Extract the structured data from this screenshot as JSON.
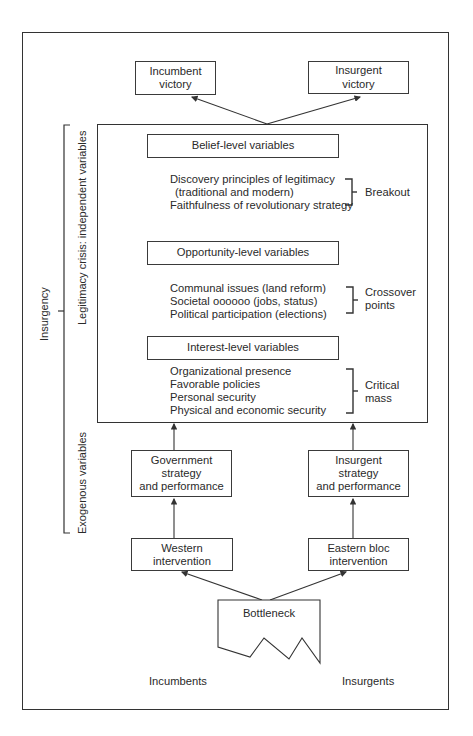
{
  "outcomes": {
    "incumbent_victory": "Incumbent\nvictory",
    "insurgent_victory": "Insurgent\nvictory"
  },
  "side_labels": {
    "insurgency": "Insurgency",
    "legitimacy_crisis": "Legitimacy crisis: independent variables",
    "exogenous": "Exogenous variables"
  },
  "levels": [
    {
      "header": "Belief-level variables",
      "items": [
        "Discovery principles of legitimacy",
        "(traditional and modern)",
        "Faithfulness of revolutionary strategy"
      ],
      "threshold": "Breakout"
    },
    {
      "header": "Opportunity-level variables",
      "items": [
        "Communal issues (land reform)",
        "Societal oooooo (jobs, status)",
        "Political participation (elections)"
      ],
      "threshold": "Crossover\npoints"
    },
    {
      "header": "Interest-level variables",
      "items": [
        "Organizational presence",
        "Favorable policies",
        "Personal security",
        "Physical and economic security"
      ],
      "threshold": "Critical\nmass"
    }
  ],
  "strategy": {
    "government": "Government\nstrategy\nand performance",
    "insurgent": "Insurgent\nstrategy\nand performance"
  },
  "intervention": {
    "western": "Western\nintervention",
    "eastern": "Eastern bloc\nintervention"
  },
  "bottleneck": "Bottleneck",
  "actors": {
    "incumbents": "Incumbents",
    "insurgents": "Insurgents"
  },
  "colors": {
    "line": "#333333",
    "text": "#2a2a2a",
    "background": "#ffffff"
  }
}
